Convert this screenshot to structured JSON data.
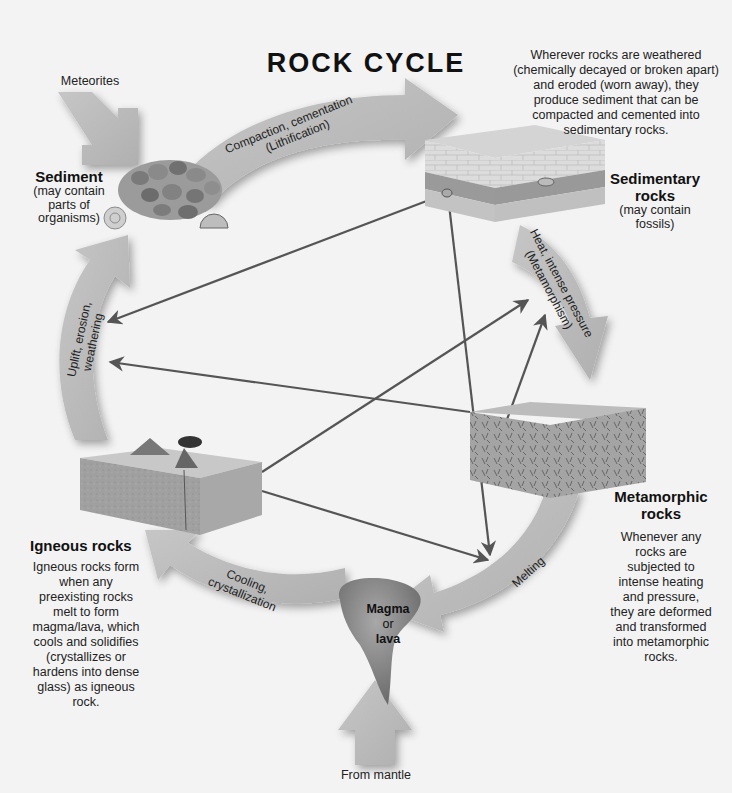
{
  "title": "ROCK CYCLE",
  "inputs": {
    "meteorites": "Meteorites",
    "from_mantle": "From mantle"
  },
  "nodes": {
    "sediment": {
      "name": "Sediment",
      "note_lines": [
        "(may contain",
        "parts of",
        "organisms)"
      ]
    },
    "sedimentary": {
      "name_lines": [
        "Sedimentary",
        "rocks"
      ],
      "note_lines": [
        "(may contain",
        "fossils)"
      ],
      "description_lines": [
        "Wherever rocks are weathered",
        "(chemically decayed or broken apart)",
        "and eroded (worn away), they",
        "produce sediment that can be",
        "compacted and cemented into",
        "sedimentary rocks."
      ]
    },
    "metamorphic": {
      "name_lines": [
        "Metamorphic",
        "rocks"
      ],
      "description_lines": [
        "Whenever any",
        "rocks are",
        "subjected to",
        "intense heating",
        "and pressure,",
        "they are deformed",
        "and transformed",
        "into metamorphic",
        "rocks."
      ]
    },
    "igneous": {
      "name": "Igneous rocks",
      "description_lines": [
        "Igneous rocks form",
        "when any",
        "preexisting rocks",
        "melt to form",
        "magma/lava, which",
        "cools and solidifies",
        "(crystallizes or",
        "hardens into dense",
        "glass) as igneous",
        "rock."
      ]
    },
    "magma": {
      "line1": "Magma",
      "line2": "or",
      "line3": "lava"
    }
  },
  "processes": {
    "lithification": {
      "line1": "Compaction, cementation",
      "line2": "(Lithification)"
    },
    "metamorphism": {
      "line1": "Heat, intense pressure",
      "line2": "(Metamorphism)"
    },
    "melting": {
      "line1": "Melting"
    },
    "cooling": {
      "line1": "Cooling,",
      "line2": "crystallization"
    },
    "uplift": {
      "line1": "Uplift, erosion,",
      "line2": "weathering"
    }
  },
  "colors": {
    "background": "#f3f3f3",
    "arrow_fill": "#b9b9b9",
    "arrow_shadow": "#9a9a9a",
    "connector_line": "#5a5a5a",
    "block_top": "#d2d2d2",
    "block_side": "#9c9c9c",
    "magma": "#7f7f7f"
  }
}
